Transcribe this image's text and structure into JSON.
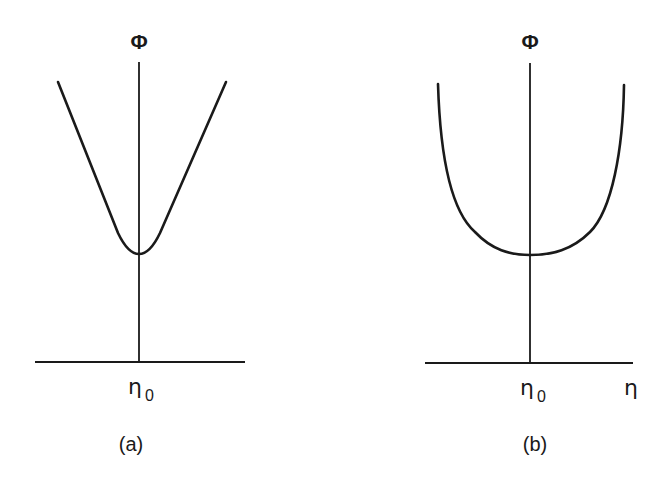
{
  "figure": {
    "panels": [
      {
        "id": "a",
        "caption": "(a)",
        "y_axis_label": "Φ",
        "x_tick_label": "η",
        "x_tick_subscript": "0",
        "curve_shape": "V-shaped with rounded minimum at η0"
      },
      {
        "id": "b",
        "caption": "(b)",
        "y_axis_label": "Φ",
        "x_tick_label": "η",
        "x_tick_subscript": "0",
        "x_axis_label": "η",
        "curve_shape": "U-shaped with flat bottom around η0"
      }
    ],
    "colors": {
      "stroke": "#1a1a1a",
      "background": "#ffffff"
    }
  }
}
